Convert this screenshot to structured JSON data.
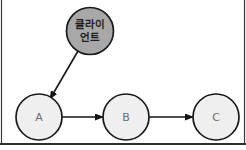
{
  "diagram": {
    "background_color": "#ffffff",
    "nodes": [
      {
        "id": "client",
        "label_line1": "클라이",
        "label_line2": "언트",
        "shape": "circle",
        "cx": 90,
        "cy": 31,
        "r": 23.5,
        "fill": "#a8a8a8",
        "stroke": "#1a1a1a",
        "text_color": "#1d1d1d"
      },
      {
        "id": "a",
        "label": "A",
        "shape": "circle",
        "cx": 39,
        "cy": 117,
        "r": 23,
        "fill": "#efefef",
        "stroke": "#1a1a1a",
        "text_color": "#6d6d6d"
      },
      {
        "id": "b",
        "label": "B",
        "shape": "circle",
        "cx": 126,
        "cy": 117,
        "r": 23,
        "fill": "#efefef",
        "stroke": "#1a1a1a",
        "text_color": "#6d6d6d"
      },
      {
        "id": "c",
        "label": "C",
        "shape": "circle",
        "cx": 216,
        "cy": 117,
        "r": 23,
        "fill": "#efefef",
        "stroke": "#1a1a1a",
        "text_color": "#6d6d6d"
      }
    ],
    "edges": [
      {
        "id": "client-to-a",
        "from": "client",
        "to": "a",
        "label": "",
        "arrow": "end",
        "x1": 78,
        "y1": 51,
        "x2": 50,
        "y2": 99,
        "color": "#151515"
      },
      {
        "id": "a-to-b",
        "from": "a",
        "to": "b",
        "label": "",
        "arrow": "end",
        "x1": 62,
        "y1": 117,
        "x2": 103,
        "y2": 117,
        "color": "#151515"
      },
      {
        "id": "b-to-c",
        "from": "b",
        "to": "c",
        "label": "",
        "arrow": "end",
        "x1": 149,
        "y1": 117,
        "x2": 193,
        "y2": 117,
        "color": "#151515"
      }
    ],
    "frame": {
      "left_rule_color": "#3a3a3a",
      "right_rule_color": "#3a3a3a",
      "baseline_color": "#2e2e2e",
      "baseline_y": 144
    }
  }
}
